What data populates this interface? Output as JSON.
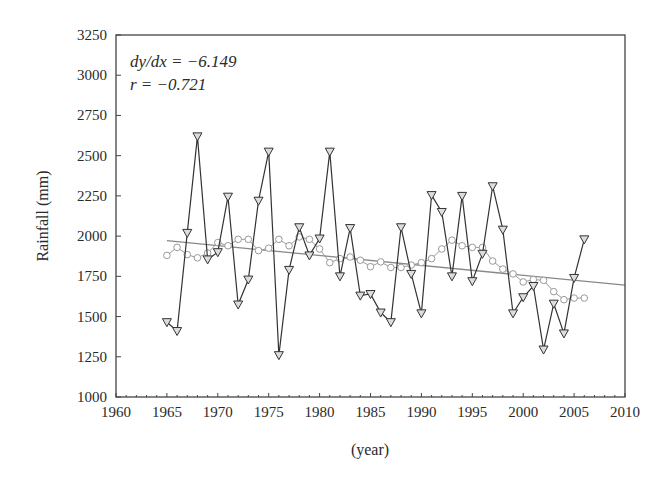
{
  "chart_data": {
    "type": "line",
    "title": "",
    "xlabel": "(year)",
    "ylabel": "Rainfall (mm)",
    "xlim": [
      1960,
      2010
    ],
    "ylim": [
      1000,
      3250
    ],
    "xticks": [
      1960,
      1965,
      1970,
      1975,
      1980,
      1985,
      1990,
      1995,
      2000,
      2005,
      2010
    ],
    "yticks": [
      1000,
      1250,
      1500,
      1750,
      2000,
      2250,
      2500,
      2750,
      3000,
      3250
    ],
    "grid": false,
    "annotations": [
      "dy/dx = −6.149",
      "r = −0.721"
    ],
    "x": [
      1965,
      1966,
      1967,
      1968,
      1969,
      1970,
      1971,
      1972,
      1973,
      1974,
      1975,
      1976,
      1977,
      1978,
      1979,
      1980,
      1981,
      1982,
      1983,
      1984,
      1985,
      1986,
      1987,
      1988,
      1989,
      1990,
      1991,
      1992,
      1993,
      1994,
      1995,
      1996,
      1997,
      1998,
      1999,
      2000,
      2001,
      2002,
      2003,
      2004,
      2005,
      2006
    ],
    "series": [
      {
        "name": "Annual rainfall",
        "marker": "triangle-down",
        "color": "#333333",
        "values": [
          1465,
          1410,
          2020,
          2620,
          1855,
          1900,
          2245,
          1575,
          1730,
          2220,
          2525,
          1260,
          1790,
          2055,
          1880,
          1985,
          2525,
          1750,
          2050,
          1630,
          1640,
          1525,
          1465,
          2055,
          1765,
          1520,
          2255,
          2150,
          1750,
          2250,
          1720,
          1890,
          2310,
          2040,
          1520,
          1620,
          1690,
          1295,
          1580,
          1395,
          1740,
          1980
        ]
      },
      {
        "name": "Moving average",
        "marker": "circle",
        "color": "#999999",
        "values": [
          1880,
          1930,
          1885,
          1865,
          1895,
          1960,
          1940,
          1980,
          1980,
          1910,
          1925,
          1980,
          1940,
          1995,
          1980,
          1920,
          1835,
          1860,
          1870,
          1850,
          1810,
          1840,
          1805,
          1805,
          1820,
          1835,
          1860,
          1920,
          1975,
          1940,
          1930,
          1930,
          1845,
          1795,
          1765,
          1715,
          1730,
          1725,
          1655,
          1605,
          1615,
          1615
        ]
      }
    ],
    "trend_line": {
      "name": "Linear trend",
      "color": "#888888",
      "x": [
        1965,
        2010
      ],
      "y": [
        1972,
        1695
      ]
    }
  },
  "labels": {
    "annotation_slope": "dy/dx = −6.149",
    "annotation_r": "r = −0.721",
    "xlabel": "(year)",
    "ylabel": "Rainfall (mm)"
  }
}
